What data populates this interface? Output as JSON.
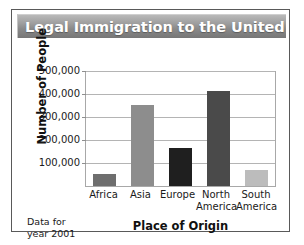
{
  "title": "Legal Immigration to the United States",
  "note_lines": [
    "Data for",
    "year 2001"
  ],
  "chart_data": {
    "type": "bar",
    "title": "Legal Immigration to the United States",
    "xlabel": "Place of Origin",
    "ylabel": "Number of People",
    "categories": [
      "Africa",
      "Asia",
      "Europe",
      "North America",
      "South America"
    ],
    "category_lines": [
      [
        "Africa"
      ],
      [
        "Asia"
      ],
      [
        "Europe"
      ],
      [
        "North",
        "America"
      ],
      [
        "South",
        "America"
      ]
    ],
    "values": [
      53000,
      350000,
      165000,
      410000,
      68000
    ],
    "bar_colors": [
      "#6e6e6e",
      "#8d8d8d",
      "#1f1f1f",
      "#4a4a4a",
      "#bcbcbc"
    ],
    "ylim": [
      0,
      500000
    ],
    "yticks": [
      500000,
      400000,
      300000,
      200000,
      100000
    ],
    "ytick_labels": [
      "500,000",
      "400,000",
      "300,000",
      "200,000",
      "100,000"
    ],
    "grid": true,
    "legend": "none",
    "annotation": "Data for year 2001"
  },
  "colors": {
    "title_bar_dark": "#767676",
    "title_bar_light": "#b9b9b9",
    "title_text": "#ffffff",
    "frame": "#595959",
    "gridline": "#b4b4b4",
    "axis": "#a8a8a8"
  }
}
